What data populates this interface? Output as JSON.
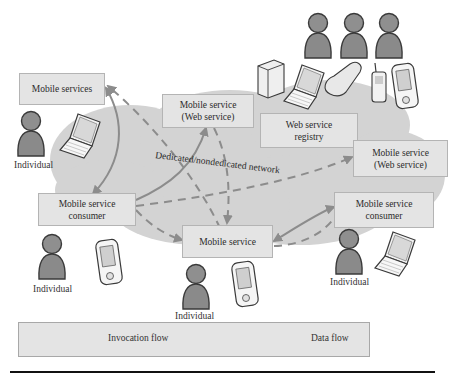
{
  "diagram": {
    "network_label": "Dedicated/nondedicated network",
    "boxes": {
      "mobile_services": "Mobile services",
      "web_service_top_line1": "Mobile service",
      "web_service_top_line2": "(Web service)",
      "registry_line1": "Web service",
      "registry_line2": "registry",
      "web_service_right_line1": "Mobile service",
      "web_service_right_line2": "(Web service)",
      "consumer_left_line1": "Mobile service",
      "consumer_left_line2": "consumer",
      "mobile_service_bottom": "Mobile service",
      "consumer_right_line1": "Mobile service",
      "consumer_right_line2": "consumer"
    },
    "individuals": [
      "Individual",
      "Individual",
      "Individual",
      "Individual"
    ]
  },
  "legend": {
    "invocation": "Invocation flow",
    "data": "Data flow"
  },
  "colors": {
    "cloud": "#d3d3d3",
    "box_fill": "#e4e4e4",
    "box_border": "#b4b4b4",
    "arrow": "#8c8c8c",
    "person": "#8a8a8a"
  }
}
